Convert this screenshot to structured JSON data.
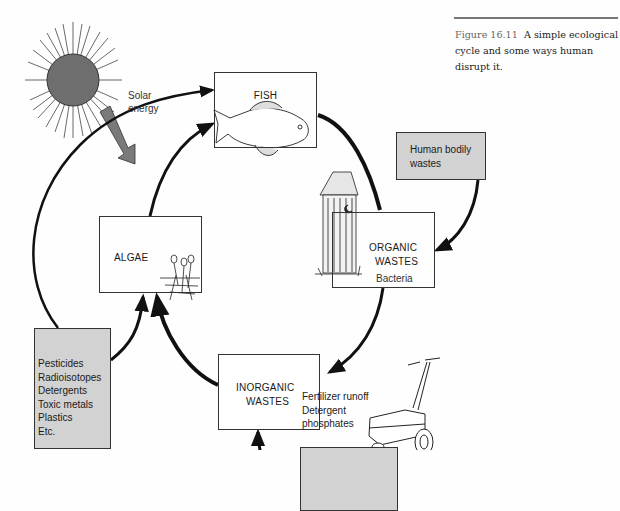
{
  "caption": {
    "figure_number": "Figure 16.11",
    "text": "A simple ecological cycle and some ways human disrupt it."
  },
  "nodes": {
    "fish": {
      "label": "FISH"
    },
    "algae": {
      "label": "ALGAE"
    },
    "organic": {
      "line1": "ORGANIC",
      "line2": "WASTES"
    },
    "inorganic": {
      "line1": "INORGANIC",
      "line2": "WASTES"
    }
  },
  "inputs": {
    "human_bodily": {
      "line1": "Human bodily",
      "line2": "wastes"
    },
    "pollutants": {
      "items": [
        "Pesticides",
        "Radioisotopes",
        "Detergents",
        "Toxic metals",
        "Plastics",
        "Etc."
      ]
    },
    "fertilizer": {
      "items": [
        "Fertilizer runoff",
        "Detergent",
        "phosphates"
      ]
    }
  },
  "labels": {
    "solar_line1": "Solar",
    "solar_line2": "energy",
    "bacteria": "Bacteria"
  },
  "illustrations": [
    "sun-icon",
    "fish-illustration",
    "algae-illustration",
    "outhouse-illustration",
    "fertilizer-spreader-illustration"
  ],
  "colors": {
    "shaded_box": "#d2d2d2",
    "sun": "#6e6e6e",
    "solar_arrow": "#7a7a7a",
    "cycle_arrows": "#111111"
  }
}
